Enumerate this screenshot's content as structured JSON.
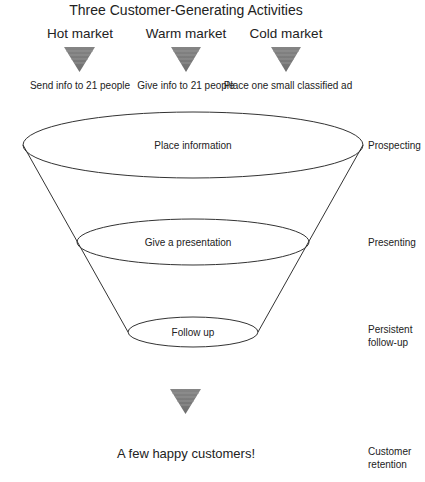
{
  "title": "Three Customer-Generating Activities",
  "markets": [
    {
      "label": "Hot market",
      "action": "Send info to 21 people"
    },
    {
      "label": "Warm market",
      "action": "Give info to 21 people"
    },
    {
      "label": "Cold market",
      "action": "Place one small classified ad"
    }
  ],
  "funnel": {
    "levels": [
      {
        "label": "Place information",
        "stage": "Prospecting"
      },
      {
        "label": "Give a presentation",
        "stage": "Presenting"
      },
      {
        "label": "Follow up",
        "stage_line1": "Persistent",
        "stage_line2": "follow-up"
      }
    ]
  },
  "result": {
    "label": "A few happy customers!",
    "stage_line1": "Customer",
    "stage_line2": "retention"
  },
  "colors": {
    "triangle_fill": "#7a7a7a",
    "triangle_stripe": "#9a9a9a",
    "line": "#333333",
    "text": "#222222"
  }
}
